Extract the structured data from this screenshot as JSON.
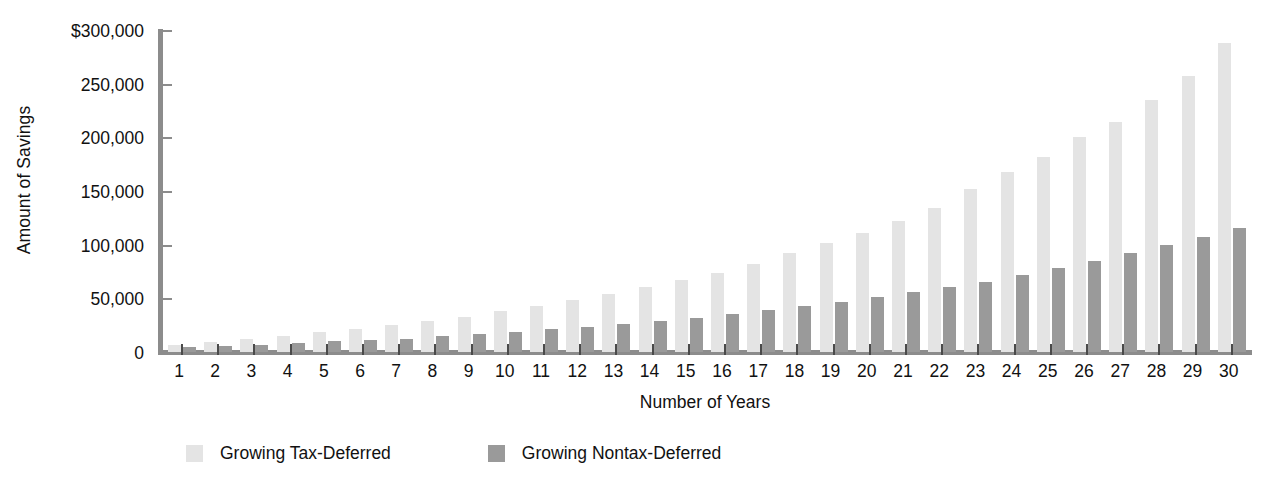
{
  "chart_data": {
    "type": "bar",
    "title": "",
    "xlabel": "Number of Years",
    "ylabel": "Amount of Savings",
    "ylim": [
      0,
      300000
    ],
    "ytick_values": [
      0,
      50000,
      100000,
      150000,
      200000,
      250000,
      300000
    ],
    "ytick_labels": [
      "0",
      "50,000",
      "100,000",
      "150,000",
      "200,000",
      "250,000",
      "$300,000"
    ],
    "grid": false,
    "legend_position": "bottom",
    "categories": [
      "1",
      "2",
      "3",
      "4",
      "5",
      "6",
      "7",
      "8",
      "9",
      "10",
      "11",
      "12",
      "13",
      "14",
      "15",
      "16",
      "17",
      "18",
      "19",
      "20",
      "21",
      "22",
      "23",
      "24",
      "25",
      "26",
      "27",
      "28",
      "29",
      "30"
    ],
    "series": [
      {
        "name": "Growing Tax-Deferred",
        "color": "#e4e4e4",
        "values": [
          6500,
          9500,
          12000,
          15000,
          18500,
          21500,
          25000,
          29000,
          33000,
          38000,
          43000,
          48500,
          54000,
          60500,
          67000,
          74000,
          82000,
          92000,
          102000,
          111000,
          122000,
          134000,
          152000,
          168000,
          182000,
          200000,
          214000,
          235000,
          257000,
          288000
        ]
      },
      {
        "name": "Growing Nontax-Deferred",
        "color": "#9a9a9a",
        "values": [
          4500,
          6000,
          7000,
          8000,
          10000,
          11000,
          12500,
          14500,
          16500,
          19000,
          21500,
          23500,
          26000,
          29000,
          32000,
          35000,
          39000,
          43000,
          47000,
          51500,
          56000,
          60500,
          65500,
          71500,
          78000,
          84500,
          92000,
          99500,
          107000,
          116000
        ]
      }
    ]
  },
  "axes": {
    "y_title": "Amount of Savings",
    "x_title": "Number of Years"
  },
  "legend": {
    "items": [
      {
        "label": "Growing Tax-Deferred",
        "color": "#e4e4e4"
      },
      {
        "label": "Growing Nontax-Deferred",
        "color": "#9a9a9a"
      }
    ]
  }
}
